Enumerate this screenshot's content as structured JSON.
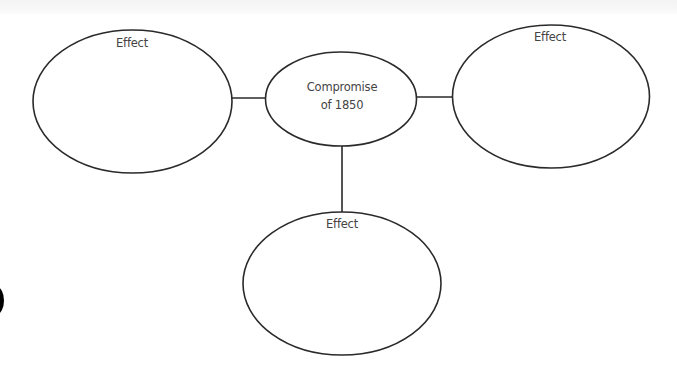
{
  "diagram": {
    "type": "cause-effect web",
    "center": {
      "label_line1": "Compromise",
      "label_line2": "of 1850"
    },
    "effects": [
      {
        "position": "left",
        "label": "Effect"
      },
      {
        "position": "right",
        "label": "Effect"
      },
      {
        "position": "bottom",
        "label": "Effect"
      }
    ]
  },
  "colors": {
    "stroke": "#2a2a2a",
    "text": "#444444",
    "background": "#ffffff"
  }
}
